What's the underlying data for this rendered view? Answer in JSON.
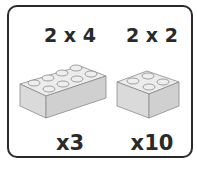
{
  "bricks": [
    {
      "size_label": "2 x 4",
      "quantity_label": "x3"
    },
    {
      "size_label": "2 x 2",
      "quantity_label": "x10"
    }
  ],
  "colors": {
    "border": "#2a2a2a",
    "brick_fill": "#e2e2e2",
    "brick_side": "#d0d0d0",
    "brick_outline": "#8a8a8a"
  }
}
